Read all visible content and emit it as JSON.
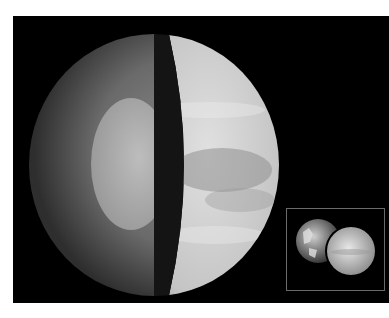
{
  "image": {
    "subject": "Venus interior cutaway with Earth-Venus size comparison inset",
    "background_color": "#ffffff",
    "panel_color": "#000000",
    "main_planet": {
      "name": "Venus",
      "layers": [
        "crust",
        "mantle",
        "core"
      ],
      "colors": {
        "mantle_outer": "#3a3a3a",
        "mantle_inner": "#7a7a7a",
        "core": "#b4b4b4",
        "cut_band": "#141414",
        "surface_light": "#e6e6e6",
        "surface_dark": "#8c8c8c"
      }
    },
    "inset": {
      "bodies": [
        "Earth",
        "Venus"
      ],
      "frame_color": "#6a6a6a"
    }
  }
}
